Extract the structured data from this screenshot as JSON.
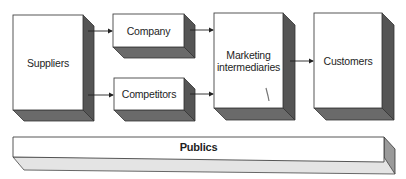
{
  "diagram": {
    "type": "marketing-environment-flow",
    "colors": {
      "front_face": "#ffffff",
      "side_face_dark": "#555555",
      "bottom_face_dark": "#6a6a6a",
      "side_face_light": "#9a9a9a",
      "bottom_face_light": "#e4e4e4",
      "outline": "#333333",
      "arrow": "#222222"
    },
    "nodes": {
      "suppliers": {
        "label": "Suppliers"
      },
      "company": {
        "label": "Company"
      },
      "competitors": {
        "label": "Competitors"
      },
      "marketing_intermediaries": {
        "label": "Marketing intermediaries"
      },
      "customers": {
        "label": "Customers"
      },
      "publics": {
        "label": "Publics"
      }
    },
    "edges": [
      {
        "from": "Suppliers",
        "to": "Company"
      },
      {
        "from": "Suppliers",
        "to": "Competitors"
      },
      {
        "from": "Company",
        "to": "Marketing intermediaries"
      },
      {
        "from": "Competitors",
        "to": "Marketing intermediaries"
      },
      {
        "from": "Marketing intermediaries",
        "to": "Customers"
      }
    ]
  }
}
